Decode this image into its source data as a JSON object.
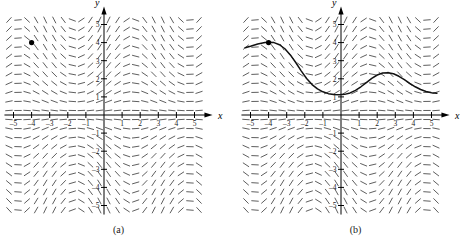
{
  "figure": {
    "type": "direction-field-figure",
    "panels": [
      {
        "id": "a",
        "caption": "(a)",
        "has_solution_curve": false,
        "initial_point_marker": true
      },
      {
        "id": "b",
        "caption": "(b)",
        "has_solution_curve": true,
        "initial_point_marker": true
      }
    ]
  },
  "axes": {
    "x_label": "x",
    "y_label": "y",
    "x_ticks": [
      "-5",
      "-4",
      "-3",
      "-2",
      "-1",
      "1",
      "2",
      "3",
      "4",
      "5"
    ],
    "y_ticks": [
      "-5",
      "-4",
      "-3",
      "-2",
      "-1",
      "1",
      "2",
      "3",
      "4",
      "5"
    ],
    "xlim": [
      -5.5,
      5.5
    ],
    "ylim": [
      -5.5,
      5.5
    ],
    "grid": false
  },
  "chart_data": {
    "type": "line",
    "title": "",
    "xlabel": "x",
    "ylabel": "y",
    "xlim": [
      -5.5,
      5.5
    ],
    "ylim": [
      -5.5,
      5.5
    ],
    "grid": false,
    "legend": "none",
    "x_tick_labels": [
      "-5",
      "-4",
      "-3",
      "-2",
      "-1",
      "1",
      "2",
      "3",
      "4",
      "5"
    ],
    "y_tick_labels": [
      "-5",
      "-4",
      "-3",
      "-2",
      "-1",
      "1",
      "2",
      "3",
      "4",
      "5"
    ],
    "annotations": [
      "(a)",
      "(b)"
    ],
    "direction_field": {
      "description": "slope field of dy/dx = y*cos(x) style ODE; short dashes on a regular lattice",
      "x_range": [
        -5.25,
        5.25
      ],
      "y_range": [
        -5.25,
        5.25
      ],
      "nx": 22,
      "ny": 22,
      "segment_length_px": 6.6,
      "color": "#555555"
    },
    "initial_point": {
      "x": -4,
      "y": 4,
      "label": ""
    },
    "series": [
      {
        "name": "solution curve",
        "panel": "b",
        "color": "#111111",
        "x": [
          -5.3,
          -5.0,
          -4.6,
          -4.2,
          -4.0,
          -3.7,
          -3.4,
          -3.1,
          -2.8,
          -2.5,
          -2.2,
          -1.9,
          -1.6,
          -1.3,
          -1.0,
          -0.7,
          -0.4,
          -0.1,
          0.2,
          0.5,
          0.8,
          1.1,
          1.4,
          1.7,
          2.0,
          2.3,
          2.6,
          2.9,
          3.2,
          3.5,
          3.8,
          4.1,
          4.4,
          4.7,
          5.0,
          5.3
        ],
        "values": [
          3.72,
          3.8,
          3.92,
          4.0,
          4.02,
          4.0,
          3.88,
          3.66,
          3.32,
          2.9,
          2.44,
          2.02,
          1.68,
          1.44,
          1.28,
          1.18,
          1.13,
          1.12,
          1.14,
          1.22,
          1.36,
          1.56,
          1.79,
          2.02,
          2.21,
          2.32,
          2.34,
          2.28,
          2.14,
          1.96,
          1.75,
          1.56,
          1.41,
          1.3,
          1.23,
          1.2
        ]
      }
    ]
  }
}
